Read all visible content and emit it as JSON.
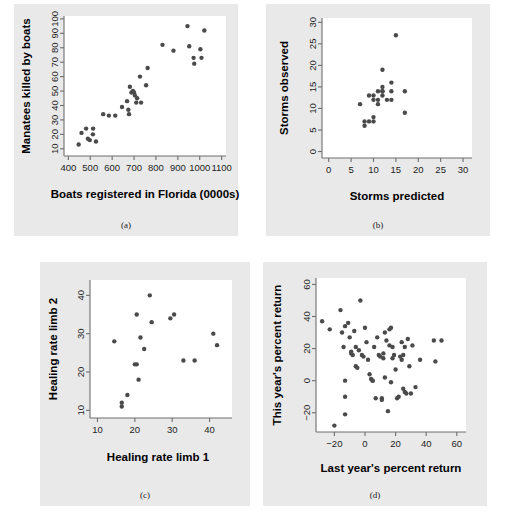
{
  "figure": {
    "title": "",
    "panel_count": 4
  },
  "chart_data": [
    {
      "id": "a",
      "type": "scatter",
      "caption": "(a)",
      "title": "",
      "xlabel": "Boats registered in Florida (0000s)",
      "ylabel": "Manatees killed by boats",
      "xlim": [
        380,
        1120
      ],
      "ylim": [
        5,
        102
      ],
      "xticks": [
        400,
        500,
        600,
        700,
        800,
        900,
        1000,
        1100
      ],
      "yticks": [
        10,
        20,
        30,
        40,
        50,
        60,
        70,
        80,
        90,
        100
      ],
      "grid": false,
      "legend": "none",
      "points": [
        [
          447,
          13
        ],
        [
          460,
          21
        ],
        [
          481,
          24
        ],
        [
          489,
          17
        ],
        [
          498,
          16
        ],
        [
          513,
          24
        ],
        [
          512,
          20
        ],
        [
          526,
          15
        ],
        [
          559,
          34
        ],
        [
          585,
          33
        ],
        [
          614,
          33
        ],
        [
          645,
          39
        ],
        [
          668,
          43
        ],
        [
          674,
          37
        ],
        [
          677,
          34
        ],
        [
          681,
          53
        ],
        [
          688,
          49
        ],
        [
          695,
          50
        ],
        [
          700,
          49
        ],
        [
          704,
          47
        ],
        [
          710,
          42
        ],
        [
          714,
          45
        ],
        [
          727,
          60
        ],
        [
          732,
          42
        ],
        [
          755,
          54
        ],
        [
          762,
          66
        ],
        [
          830,
          82
        ],
        [
          880,
          78
        ],
        [
          944,
          95
        ],
        [
          952,
          81
        ],
        [
          972,
          73
        ],
        [
          975,
          69
        ],
        [
          1003,
          79
        ],
        [
          1008,
          73
        ],
        [
          1021,
          92
        ]
      ]
    },
    {
      "id": "b",
      "type": "scatter",
      "caption": "(b)",
      "title": "",
      "xlabel": "Storms predicted",
      "ylabel": "Storms observed",
      "xlim": [
        -1.5,
        32
      ],
      "ylim": [
        -1.5,
        31
      ],
      "xticks": [
        0,
        5,
        10,
        15,
        20,
        25,
        30
      ],
      "yticks": [
        0,
        5,
        10,
        15,
        20,
        25,
        30
      ],
      "grid": false,
      "legend": "none",
      "points": [
        [
          7,
          11
        ],
        [
          8,
          7
        ],
        [
          8,
          6
        ],
        [
          9,
          7
        ],
        [
          9,
          13
        ],
        [
          10,
          12
        ],
        [
          10,
          13
        ],
        [
          10,
          8
        ],
        [
          10,
          7
        ],
        [
          11,
          14
        ],
        [
          11,
          12
        ],
        [
          11,
          11
        ],
        [
          12,
          15
        ],
        [
          12,
          19
        ],
        [
          12,
          14
        ],
        [
          12,
          13
        ],
        [
          12,
          14
        ],
        [
          13,
          12
        ],
        [
          14,
          16
        ],
        [
          14,
          14
        ],
        [
          14,
          12
        ],
        [
          15,
          27
        ],
        [
          17,
          14
        ],
        [
          17,
          9
        ]
      ]
    },
    {
      "id": "c",
      "type": "scatter",
      "caption": "(c)",
      "title": "",
      "xlabel": "Healing rate limb 1",
      "ylabel": "Healing rate limb 2",
      "xlim": [
        8,
        46
      ],
      "ylim": [
        8,
        44
      ],
      "xticks": [
        10,
        20,
        30,
        40
      ],
      "yticks": [
        10,
        20,
        30,
        40
      ],
      "grid": false,
      "legend": "none",
      "points": [
        [
          14.5,
          28
        ],
        [
          16.5,
          12
        ],
        [
          16.5,
          11
        ],
        [
          18,
          14
        ],
        [
          20,
          22
        ],
        [
          20.5,
          22
        ],
        [
          20.5,
          35
        ],
        [
          21,
          18
        ],
        [
          21.5,
          29
        ],
        [
          22.5,
          26
        ],
        [
          24,
          40
        ],
        [
          24.5,
          33
        ],
        [
          29.5,
          34
        ],
        [
          30.5,
          35
        ],
        [
          33,
          23
        ],
        [
          36,
          23
        ],
        [
          41,
          30
        ],
        [
          42,
          27
        ]
      ]
    },
    {
      "id": "d",
      "type": "scatter",
      "caption": "(d)",
      "title": "",
      "xlabel": "Last year's percent return",
      "ylabel": "This year's percent return",
      "xlim": [
        -32,
        66
      ],
      "ylim": [
        -32,
        64
      ],
      "xticks": [
        -20,
        0,
        20,
        40,
        60
      ],
      "yticks": [
        -20,
        0,
        20,
        40,
        60
      ],
      "grid": false,
      "legend": "none",
      "points": [
        [
          -28,
          37
        ],
        [
          -23,
          32
        ],
        [
          -20,
          -28
        ],
        [
          -16,
          44
        ],
        [
          -15,
          30
        ],
        [
          -14,
          21
        ],
        [
          -13,
          34
        ],
        [
          -13,
          -10
        ],
        [
          -13,
          0
        ],
        [
          -13,
          -21
        ],
        [
          -11,
          36
        ],
        [
          -10,
          27
        ],
        [
          -9,
          18
        ],
        [
          -9,
          17
        ],
        [
          -8,
          16
        ],
        [
          -7,
          31
        ],
        [
          -6,
          21
        ],
        [
          -6,
          9
        ],
        [
          -5,
          8
        ],
        [
          -4,
          19
        ],
        [
          -3,
          50
        ],
        [
          -2,
          16
        ],
        [
          -1,
          15
        ],
        [
          0,
          33
        ],
        [
          1,
          24
        ],
        [
          2,
          13
        ],
        [
          3,
          4
        ],
        [
          4,
          1
        ],
        [
          5,
          0
        ],
        [
          5,
          0
        ],
        [
          6,
          21
        ],
        [
          7,
          -11
        ],
        [
          8,
          27
        ],
        [
          9,
          16
        ],
        [
          10,
          15
        ],
        [
          11,
          -11
        ],
        [
          11,
          -12
        ],
        [
          12,
          17
        ],
        [
          12,
          14
        ],
        [
          13,
          30
        ],
        [
          13,
          2
        ],
        [
          14,
          25
        ],
        [
          15,
          -19
        ],
        [
          16,
          32
        ],
        [
          16,
          22
        ],
        [
          17,
          33
        ],
        [
          17,
          -1
        ],
        [
          18,
          21
        ],
        [
          18,
          14
        ],
        [
          19,
          16
        ],
        [
          20,
          7
        ],
        [
          21,
          -11
        ],
        [
          22,
          -10
        ],
        [
          23,
          15
        ],
        [
          24,
          24
        ],
        [
          24,
          13
        ],
        [
          25,
          16
        ],
        [
          25,
          -5
        ],
        [
          26,
          21
        ],
        [
          26,
          -7
        ],
        [
          27,
          -8
        ],
        [
          28,
          26
        ],
        [
          29,
          9
        ],
        [
          30,
          -8
        ],
        [
          31,
          22
        ],
        [
          33,
          -4
        ],
        [
          36,
          13
        ],
        [
          45,
          25
        ],
        [
          46,
          12
        ],
        [
          50,
          25
        ]
      ]
    }
  ]
}
